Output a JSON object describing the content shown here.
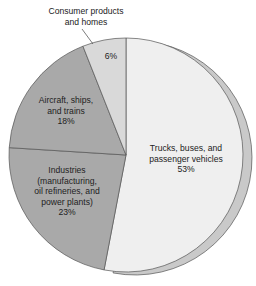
{
  "chart_data": {
    "type": "pie",
    "title": "",
    "start_angle_deg": 0,
    "direction": "clockwise",
    "slices": [
      {
        "label": "Trucks, buses, and passenger vehicles",
        "value": 53,
        "color": "#efefef",
        "exploded_3d": true
      },
      {
        "label": "Industries (manufacturing, oil refineries, and power plants)",
        "value": 23,
        "color": "#a9a9a9"
      },
      {
        "label": "Aircraft, ships, and trains",
        "value": 18,
        "color": "#a9a9a9"
      },
      {
        "label": "Consumer products and homes",
        "value": 6,
        "color": "#d9d9d9"
      }
    ],
    "units": "%",
    "legend": "none (direct labels)"
  },
  "labels": {
    "trucks": {
      "lines": [
        "Trucks, buses, and",
        "passenger vehicles"
      ],
      "pct": "53%"
    },
    "industries": {
      "lines": [
        "Industries",
        "(manufacturing,",
        "oil refineries, and",
        "power plants)"
      ],
      "pct": "23%"
    },
    "aircraft": {
      "lines": [
        "Aircraft, ships,",
        "and trains"
      ],
      "pct": "18%"
    },
    "consumer": {
      "lines": [
        "Consumer products",
        "and homes"
      ],
      "pct": "6%"
    }
  },
  "colors": {
    "outline": "#555555",
    "shadow_rim": "#c9c9c9"
  }
}
